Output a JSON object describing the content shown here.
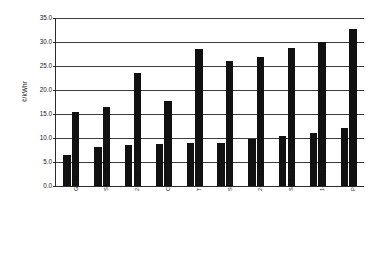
{
  "chart_data": {
    "type": "bar",
    "title": "",
    "xlabel": "",
    "ylabel": "¢/kWhr",
    "ylim": [
      0,
      35
    ],
    "ytick_step": 5,
    "ytick_labels": [
      "35.0",
      "30.0",
      "25.0",
      "20.0",
      "15.0",
      "10.0",
      "5.0",
      "0.0"
    ],
    "ytick_values": [
      35.0,
      30.0,
      25.0,
      20.0,
      15.0,
      10.0,
      5.0,
      0.0
    ],
    "grid": true,
    "legend": "none",
    "bar_color": "#111111",
    "axis_color": "#2b2b2b",
    "grid_color": "#3c3c3c",
    "categories": [
      "GaAs Dish",
      "Si Dish",
      "2-Axis Static",
      "Central Rec",
      "Thin Film",
      "Static Conc",
      "2-Axis FP",
      "Si 1-Axis Trough",
      "1-Axis FP",
      "PP"
    ],
    "series": [
      {
        "name": "low",
        "values": [
          6.5,
          8.2,
          8.6,
          8.8,
          9.0,
          9.0,
          9.8,
          10.5,
          11.0,
          12.0
        ]
      },
      {
        "name": "high",
        "values": [
          15.4,
          16.5,
          23.5,
          17.8,
          28.5,
          26.0,
          26.8,
          28.8,
          30.0,
          32.8
        ]
      }
    ]
  }
}
